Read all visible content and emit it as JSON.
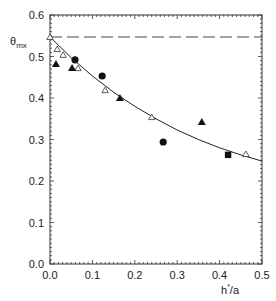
{
  "chart_data": {
    "type": "scatter",
    "title": "",
    "xlabel": "h*/a",
    "xlabel_main": "h",
    "xlabel_sup": "*",
    "xlabel_tail": "/a",
    "ylabel": "θmx",
    "ylabel_main": "θ",
    "ylabel_sub": "mx",
    "xlim": [
      0.0,
      0.5
    ],
    "ylim": [
      0.0,
      0.6
    ],
    "xticks": [
      0.0,
      0.1,
      0.2,
      0.3,
      0.4,
      0.5
    ],
    "xtick_labels": [
      "0.0",
      "0.1",
      "0.2",
      "0.3",
      "0.4",
      "0.5"
    ],
    "yticks": [
      0.0,
      0.1,
      0.2,
      0.3,
      0.4,
      0.5,
      0.6
    ],
    "ytick_labels": [
      "0.0",
      "0.1",
      "0.2",
      "0.3",
      "0.4",
      "0.5",
      "0.6"
    ],
    "grid": false,
    "legend": null,
    "reference_line": {
      "style": "dashed",
      "y": 0.547
    },
    "fit_curve": {
      "style": "solid",
      "x": [
        0.0,
        0.05,
        0.1,
        0.15,
        0.2,
        0.25,
        0.3,
        0.35,
        0.4,
        0.45,
        0.5
      ],
      "y": [
        0.547,
        0.497,
        0.453,
        0.414,
        0.38,
        0.35,
        0.323,
        0.3,
        0.28,
        0.263,
        0.248
      ]
    },
    "series": [
      {
        "name": "open triangles",
        "marker": "triangle-open",
        "x": [
          0.0,
          0.017,
          0.031,
          0.066,
          0.13,
          0.24,
          0.462
        ],
        "y": [
          0.547,
          0.518,
          0.504,
          0.472,
          0.419,
          0.354,
          0.265
        ]
      },
      {
        "name": "filled triangles",
        "marker": "triangle-filled",
        "x": [
          0.014,
          0.052,
          0.165,
          0.358
        ],
        "y": [
          0.482,
          0.472,
          0.4,
          0.342
        ]
      },
      {
        "name": "filled circles",
        "marker": "circle-filled",
        "x": [
          0.059,
          0.123,
          0.267
        ],
        "y": [
          0.492,
          0.453,
          0.294
        ]
      },
      {
        "name": "filled squares",
        "marker": "square-filled",
        "x": [
          0.42
        ],
        "y": [
          0.263
        ]
      }
    ]
  },
  "colors": {
    "axis": "#333333",
    "marker": "#111111",
    "background": "#ffffff"
  }
}
